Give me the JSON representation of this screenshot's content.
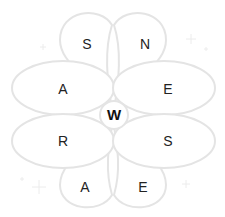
{
  "game": {
    "center_letter": "W",
    "petals": [
      {
        "position": "top-left",
        "letter": "S"
      },
      {
        "position": "top-right",
        "letter": "N"
      },
      {
        "position": "upper-left",
        "letter": "A"
      },
      {
        "position": "upper-right",
        "letter": "E"
      },
      {
        "position": "lower-left",
        "letter": "R"
      },
      {
        "position": "lower-right",
        "letter": "S"
      },
      {
        "position": "bottom-left",
        "letter": "A"
      },
      {
        "position": "bottom-right",
        "letter": "E"
      }
    ]
  },
  "colors": {
    "petal_stroke": "#e4e4e4",
    "letter": "#222222",
    "background": "#ffffff"
  }
}
